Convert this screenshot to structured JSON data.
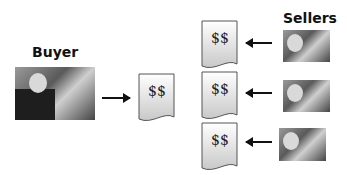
{
  "diagram": {
    "buyer": {
      "label": "Buyer",
      "image": "conductor-photo"
    },
    "buyer_document": {
      "text": "$$"
    },
    "sellers": {
      "label": "Sellers",
      "items": [
        {
          "document_text": "$$",
          "image": "seller-photo"
        },
        {
          "document_text": "$$",
          "image": "seller-photo"
        },
        {
          "document_text": "$$",
          "image": "seller-photo"
        }
      ]
    },
    "icons": {
      "arrow_right": "arrow-right-icon",
      "arrow_left": "arrow-left-icon",
      "document": "document-icon"
    }
  }
}
